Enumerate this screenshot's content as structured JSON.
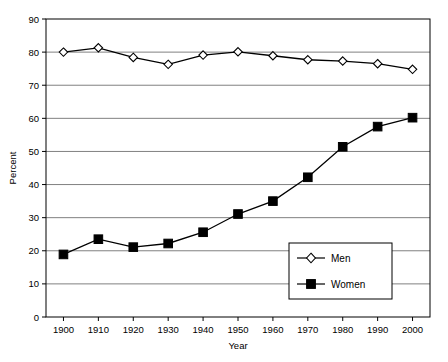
{
  "chart_data": {
    "type": "line",
    "title": "",
    "xlabel": "Year",
    "ylabel": "Percent",
    "x": [
      1900,
      1910,
      1920,
      1930,
      1940,
      1950,
      1960,
      1970,
      1980,
      1990,
      2000
    ],
    "categories": [
      "1900",
      "1910",
      "1920",
      "1930",
      "1940",
      "1950",
      "1960",
      "1970",
      "1980",
      "1990",
      "2000"
    ],
    "series": [
      {
        "name": "Men",
        "marker": "open-diamond",
        "color": "#000000",
        "values": [
          80.0,
          81.3,
          78.4,
          76.3,
          79.1,
          80.1,
          78.9,
          77.7,
          77.3,
          76.5,
          74.8
        ]
      },
      {
        "name": "Women",
        "marker": "filled-square",
        "color": "#000000",
        "values": [
          18.9,
          23.5,
          21.1,
          22.2,
          25.6,
          31.1,
          35.0,
          42.2,
          51.4,
          57.5,
          60.2
        ]
      }
    ],
    "xlim": [
      1895,
      2005
    ],
    "ylim": [
      0,
      90
    ],
    "yticks": [
      0,
      10,
      20,
      30,
      40,
      50,
      60,
      70,
      80,
      90
    ],
    "ytick_labels": [
      "0",
      "10",
      "20",
      "30",
      "40",
      "50",
      "60",
      "70",
      "80",
      "90"
    ],
    "grid": "horizontal",
    "grid_color": "#808080",
    "legend_position": "inside-bottom-right",
    "legend_entries": [
      "Men",
      "Women"
    ]
  }
}
